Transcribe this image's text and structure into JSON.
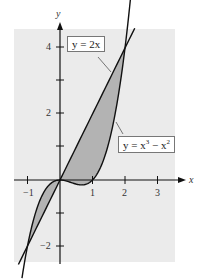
{
  "chart_data": {
    "type": "line",
    "title": "",
    "xlabel": "x",
    "ylabel": "y",
    "xlim": [
      -1.4,
      3.6
    ],
    "ylim": [
      -2.5,
      4.6
    ],
    "x_ticks": [
      -1,
      1,
      2,
      3
    ],
    "x_tick_labels": [
      "−1",
      "1",
      "2",
      "3"
    ],
    "y_ticks": [
      -2,
      -1,
      1,
      2,
      3,
      4
    ],
    "y_tick_labels": [
      "−2",
      "",
      "",
      "2",
      "",
      "4"
    ],
    "grid": false,
    "background": "#ebebeb",
    "series": [
      {
        "name": "y = 2x",
        "expression": "2x",
        "color": "#111111"
      },
      {
        "name": "y = x^3 - x^2",
        "expression": "x^3 - x^2",
        "color": "#111111"
      }
    ],
    "shaded_regions": [
      {
        "between": [
          "y = 2x",
          "y = x^3 - x^2"
        ],
        "x_range": [
          -1,
          0
        ],
        "color": "#b3b3b3"
      },
      {
        "between": [
          "y = 2x",
          "y = x^3 - x^2"
        ],
        "x_range": [
          0,
          2
        ],
        "color": "#b3b3b3"
      }
    ],
    "intersections": [
      [
        -1,
        -2
      ],
      [
        0,
        0
      ],
      [
        2,
        4
      ]
    ],
    "annotations": [
      {
        "text": "y = 2x",
        "points_to": [
          1.5,
          3
        ]
      },
      {
        "text": "y = x³ − x²",
        "points_to": [
          1.7,
          2
        ]
      }
    ]
  },
  "labels": {
    "x_axis": "x",
    "y_axis": "y",
    "line_label": "y = 2x",
    "cubic_label_base": "y = x",
    "cubic_label_exp1": "3",
    "cubic_label_mid": " − x",
    "cubic_label_exp2": "2",
    "tick_x_neg1": "−1",
    "tick_x_1": "1",
    "tick_x_2": "2",
    "tick_x_3": "3",
    "tick_y_4": "4",
    "tick_y_2": "2",
    "tick_y_neg2": "−2"
  }
}
